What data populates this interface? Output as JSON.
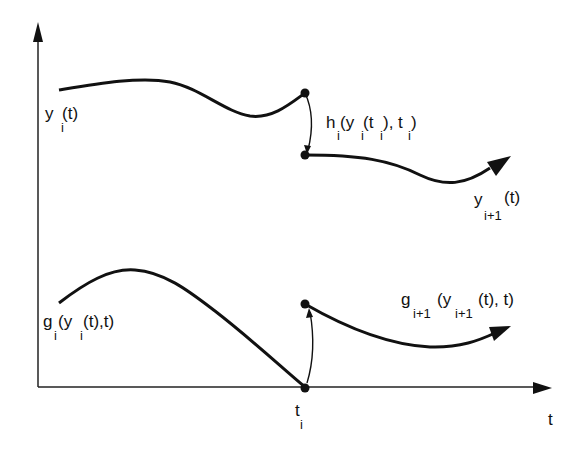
{
  "diagram": {
    "type": "hybrid-system-jump-diagram",
    "axes": {
      "x_label": "t",
      "y_label": ""
    },
    "labels": {
      "yi": {
        "main": "y",
        "sub": "i",
        "rest": "(t)"
      },
      "hi": {
        "text": "h",
        "sub1": "i",
        "p1": "(y",
        "sub2": "i",
        "p2": "(t",
        "sub3": "i",
        "p3": "), t",
        "sub4": "i",
        "p4": ")"
      },
      "yi1": {
        "main": "y",
        "sub": "i+1",
        "rest": "(t)"
      },
      "gi": {
        "main": "g",
        "sub1": "i",
        "p1": "(y",
        "sub2": "i",
        "p2": "(t),t)"
      },
      "gi1": {
        "main": "g",
        "sub1": "i+1",
        "p1": "(y",
        "sub2": "i+1",
        "p2": "(t), t)"
      },
      "ti": {
        "main": "t",
        "sub": "i"
      }
    },
    "curves": [
      {
        "name": "y_i(t)",
        "description": "trajectory before switch, ends at jump point"
      },
      {
        "name": "h_i(y_i(t_i), t_i)",
        "description": "reset map jump arrow from top dot to lower dot"
      },
      {
        "name": "y_{i+1}(t)",
        "description": "trajectory after switch with arrowhead"
      },
      {
        "name": "g_i(y_i(t),t)",
        "description": "guard function reaching zero at t_i"
      },
      {
        "name": "g_{i+1}(y_{i+1}(t), t)",
        "description": "next guard function after switch with arrowhead"
      }
    ],
    "colors": {
      "ink": "#111111",
      "background": "#ffffff"
    }
  }
}
